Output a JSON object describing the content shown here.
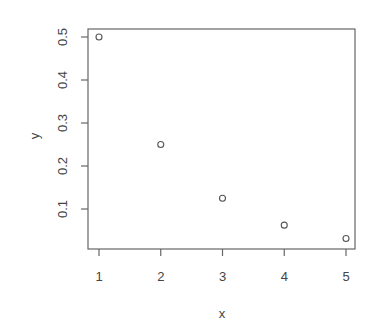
{
  "chart_data": {
    "type": "scatter",
    "title": "",
    "xlabel": "x",
    "ylabel": "y",
    "x": [
      1,
      2,
      3,
      4,
      5
    ],
    "y": [
      0.5,
      0.25,
      0.125,
      0.0625,
      0.03125
    ],
    "xlim": [
      0.84,
      5.16
    ],
    "ylim": [
      0.012,
      0.519
    ],
    "x_ticks": [
      1,
      2,
      3,
      4,
      5
    ],
    "x_tick_labels": [
      "1",
      "2",
      "3",
      "4",
      "5"
    ],
    "y_ticks": [
      0.1,
      0.2,
      0.3,
      0.4,
      0.5
    ],
    "y_tick_labels": [
      "0.1",
      "0.2",
      "0.3",
      "0.4",
      "0.5"
    ],
    "grid": false,
    "legend": null,
    "marker": "open-circle"
  },
  "colors": {
    "axis": "#666666",
    "text": "#444444",
    "marker": "#555555",
    "background": "#ffffff"
  }
}
